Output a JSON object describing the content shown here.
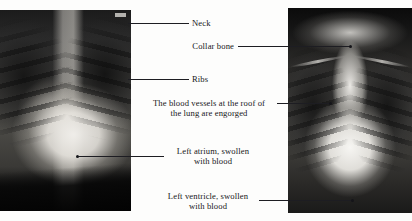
{
  "figure": {
    "background_color": "#fdfdfc",
    "text_color": "#17171a",
    "leader_color": "#1d1d22"
  },
  "images": [
    {
      "name": "left-chest-xray",
      "description": "Close-up chest radiograph, enlarged cardiac silhouette with dark diaphragm band at lower left"
    },
    {
      "name": "right-chest-xray",
      "description": "Full frontal chest radiograph showing globular enlarged heart and engorged upper lobe vessels"
    }
  ],
  "annotations": [
    {
      "id": "neck",
      "label": "Neck",
      "align": "left",
      "target_image": "left-chest-xray"
    },
    {
      "id": "collar-bone",
      "label": "Collar bone",
      "align": "right",
      "target_image": "right-chest-xray"
    },
    {
      "id": "ribs",
      "label": "Ribs",
      "align": "left",
      "target_image": "left-chest-xray"
    },
    {
      "id": "blood-vessels",
      "label": "The blood vessels at the roof of\nthe lung are engorged",
      "align": "center",
      "target_image": "right-chest-xray"
    },
    {
      "id": "left-atrium",
      "label": "Left atrium, swollen\nwith blood",
      "align": "center",
      "target_image": "left-chest-xray"
    },
    {
      "id": "left-ventricle",
      "label": "Left ventricle, swollen\nwith blood",
      "align": "center",
      "target_image": "right-chest-xray"
    }
  ]
}
